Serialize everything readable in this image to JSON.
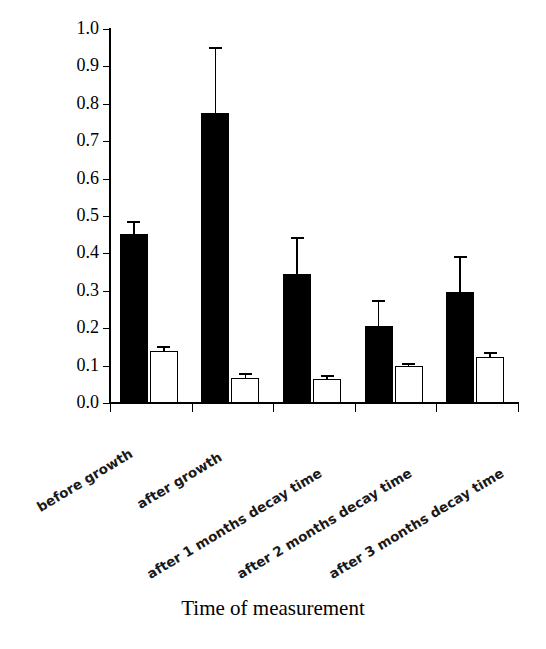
{
  "chart_data": {
    "type": "bar",
    "title": "",
    "xlabel": "Time of measurement",
    "ylabel": "hydraulic conductivity (m/day)",
    "ylim": [
      0.0,
      1.0
    ],
    "ytick_labels": [
      "0.0",
      "0.1",
      "0.2",
      "0.3",
      "0.4",
      "0.5",
      "0.6",
      "0.7",
      "0.8",
      "0.9",
      "1.0"
    ],
    "ytick_values": [
      0.0,
      0.1,
      0.2,
      0.3,
      0.4,
      0.5,
      0.6,
      0.7,
      0.8,
      0.9,
      1.0
    ],
    "grid": false,
    "legend": "none",
    "categories": [
      "before growth",
      "after growth",
      "after 1 months decay time",
      "after 2 months decay time",
      "after 3 months decay time"
    ],
    "series": [
      {
        "name": "filled",
        "style": "black-filled-bar",
        "values": [
          0.452,
          0.775,
          0.345,
          0.207,
          0.298
        ],
        "errors": [
          0.028,
          0.172,
          0.093,
          0.062,
          0.091
        ]
      },
      {
        "name": "open",
        "style": "white-open-bar",
        "values": [
          0.14,
          0.067,
          0.063,
          0.098,
          0.124
        ],
        "errors": [
          0.008,
          0.007,
          0.006,
          0.004,
          0.007
        ]
      }
    ],
    "colors": {
      "filled_bar": "#000000",
      "open_bar": "#ffffff",
      "outline": "#000000",
      "axis": "#000000",
      "background": "#ffffff"
    }
  }
}
